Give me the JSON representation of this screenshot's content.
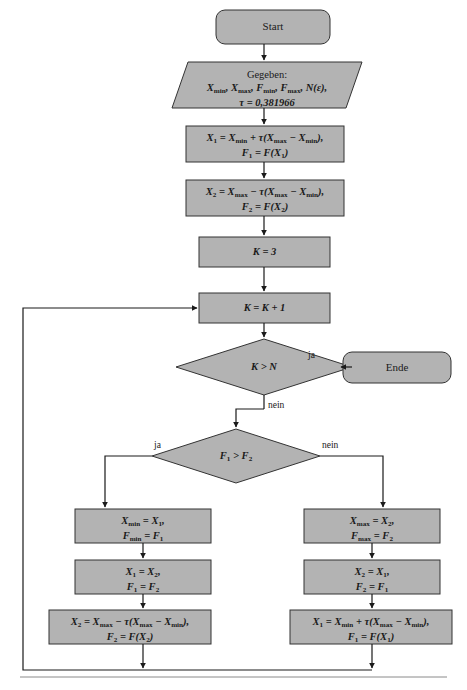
{
  "diagram": {
    "language": "de",
    "colors": {
      "node_fill": "#b3b3b3",
      "node_stroke": "#333333",
      "edge_stroke": "#1a1a1a",
      "text": "#1a1a1a",
      "background": "#ffffff"
    },
    "nodes": {
      "start": {
        "shape": "terminator",
        "label": "Start"
      },
      "input": {
        "shape": "parallelogram",
        "line1": "Gegeben:",
        "line2_html": "X<sub>min</sub>, X<sub>max</sub>, F<sub>min</sub>, F<sub>max</sub>, N(ε),",
        "line3_html": "τ = 0,381966",
        "plain": "Gegeben: Xmin, Xmax, Fmin, Fmax, N(ε), τ = 0,381966"
      },
      "init_x1": {
        "shape": "process",
        "line1_html": "X<sub>1</sub> = X<sub>min</sub> + τ(X<sub>max</sub> − X<sub>min</sub>),",
        "line2_html": "F<sub>1</sub> = F(X<sub>1</sub>)",
        "plain": "X1 = Xmin + τ(Xmax − Xmin), F1 = F(X1)"
      },
      "init_x2": {
        "shape": "process",
        "line1_html": "X<sub>2</sub> = X<sub>max</sub> − τ(X<sub>max</sub> − X<sub>min</sub>),",
        "line2_html": "F<sub>2</sub> = F(X<sub>2</sub>)",
        "plain": "X2 = Xmax − τ(Xmax − Xmin), F2 = F(X2)"
      },
      "k_init": {
        "shape": "process",
        "line1_html": "K = 3",
        "plain": "K = 3"
      },
      "k_incr": {
        "shape": "process",
        "line1_html": "K = K + 1",
        "plain": "K = K + 1"
      },
      "dec_kn": {
        "shape": "decision",
        "line1_html": "K > N",
        "plain": "K > N"
      },
      "ende": {
        "shape": "terminator",
        "label": "Ende"
      },
      "dec_ff": {
        "shape": "decision",
        "line1_html": "F<sub>1</sub> > F<sub>2</sub>",
        "plain": "F1 > F2"
      },
      "left1": {
        "shape": "process",
        "line1_html": "X<sub>min</sub> = X<sub>1</sub>,",
        "line2_html": "F<sub>min</sub> = F<sub>1</sub>",
        "plain": "Xmin = X1, Fmin = F1"
      },
      "left2": {
        "shape": "process",
        "line1_html": "X<sub>1</sub> = X<sub>2</sub>,",
        "line2_html": "F<sub>1</sub> = F<sub>2</sub>",
        "plain": "X1 = X2, F1 = F2"
      },
      "left3": {
        "shape": "process",
        "line1_html": "X<sub>2</sub> = X<sub>max</sub> − τ(X<sub>max</sub> − X<sub>min</sub>),",
        "line2_html": "F<sub>2</sub> = F(X<sub>2</sub>)",
        "plain": "X2 = Xmax − τ(Xmax − Xmin), F2 = F(X2)"
      },
      "right1": {
        "shape": "process",
        "line1_html": "X<sub>max</sub> = X<sub>2</sub>,",
        "line2_html": "F<sub>max</sub> = F<sub>2</sub>",
        "plain": "Xmax = X2, Fmax = F2"
      },
      "right2": {
        "shape": "process",
        "line1_html": "X<sub>2</sub> = X<sub>1</sub>,",
        "line2_html": "F<sub>2</sub> = F<sub>1</sub>",
        "plain": "X2 = X1, F2 = F1"
      },
      "right3": {
        "shape": "process",
        "line1_html": "X<sub>1</sub> = X<sub>min</sub> + τ(X<sub>max</sub> − X<sub>min</sub>),",
        "line2_html": "F<sub>1</sub> = F(X<sub>1</sub>)",
        "plain": "X1 = Xmin + τ(Xmax − Xmin), F1 = F(X1)"
      }
    },
    "edge_labels": {
      "kn_yes": "ja",
      "kn_no": "nein",
      "ff_yes": "ja",
      "ff_no": "nein"
    }
  }
}
